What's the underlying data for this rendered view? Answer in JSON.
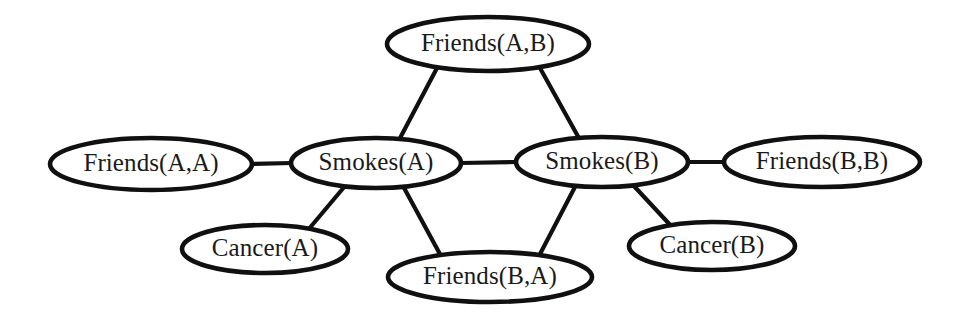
{
  "diagram": {
    "background_color": "#ffffff",
    "stroke_color": "#101010",
    "text_color": "#1a1a1a",
    "node_fill": "#ffffff",
    "width": 966,
    "height": 320,
    "nodes": [
      {
        "id": "friends-ab",
        "label": "Friends(A,B)",
        "cx": 488,
        "cy": 44,
        "rx": 101,
        "ry": 27
      },
      {
        "id": "friends-aa",
        "label": "Friends(A,A)",
        "cx": 151,
        "cy": 164,
        "rx": 101,
        "ry": 26
      },
      {
        "id": "smokes-a",
        "label": "Smokes(A)",
        "cx": 376,
        "cy": 163,
        "rx": 85,
        "ry": 25
      },
      {
        "id": "smokes-b",
        "label": "Smokes(B)",
        "cx": 602,
        "cy": 162,
        "rx": 86,
        "ry": 25
      },
      {
        "id": "friends-bb",
        "label": "Friends(B,B)",
        "cx": 822,
        "cy": 162,
        "rx": 98,
        "ry": 25
      },
      {
        "id": "cancer-a",
        "label": "Cancer(A)",
        "cx": 265,
        "cy": 249,
        "rx": 83,
        "ry": 24
      },
      {
        "id": "friends-ba",
        "label": "Friends(B,A)",
        "cx": 490,
        "cy": 277,
        "rx": 102,
        "ry": 25
      },
      {
        "id": "cancer-b",
        "label": "Cancer(B)",
        "cx": 712,
        "cy": 246,
        "rx": 83,
        "ry": 24
      }
    ],
    "edges": [
      {
        "id": "edge-friendsab-smokesa",
        "from": "friends-ab",
        "to": "smokes-a",
        "x1": 437,
        "y1": 68,
        "x2": 399,
        "y2": 140
      },
      {
        "id": "edge-friendsab-smokesb",
        "from": "friends-ab",
        "to": "smokes-b",
        "x1": 540,
        "y1": 68,
        "x2": 580,
        "y2": 140
      },
      {
        "id": "edge-friendsaa-smokesa",
        "from": "friends-aa",
        "to": "smokes-a",
        "x1": 252,
        "y1": 164,
        "x2": 292,
        "y2": 163
      },
      {
        "id": "edge-smokesa-smokesb",
        "from": "smokes-a",
        "to": "smokes-b",
        "x1": 461,
        "y1": 163,
        "x2": 516,
        "y2": 162
      },
      {
        "id": "edge-smokesb-friendsbb",
        "from": "smokes-b",
        "to": "friends-bb",
        "x1": 688,
        "y1": 162,
        "x2": 724,
        "y2": 162
      },
      {
        "id": "edge-smokesa-cancera",
        "from": "smokes-a",
        "to": "cancer-a",
        "x1": 345,
        "y1": 186,
        "x2": 308,
        "y2": 230
      },
      {
        "id": "edge-smokesa-friendsba",
        "from": "smokes-a",
        "to": "friends-ba",
        "x1": 403,
        "y1": 186,
        "x2": 441,
        "y2": 256
      },
      {
        "id": "edge-smokesb-friendsba",
        "from": "smokes-b",
        "to": "friends-ba",
        "x1": 576,
        "y1": 185,
        "x2": 539,
        "y2": 256
      },
      {
        "id": "edge-smokesb-cancerb",
        "from": "smokes-b",
        "to": "cancer-b",
        "x1": 633,
        "y1": 185,
        "x2": 673,
        "y2": 228
      }
    ]
  }
}
